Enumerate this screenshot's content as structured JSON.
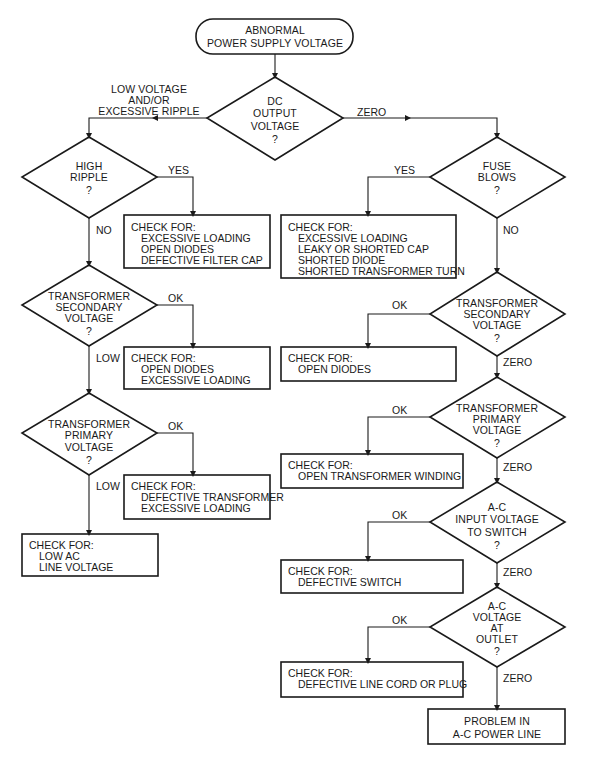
{
  "diagram": {
    "type": "flowchart",
    "topic": "Power supply troubleshooting",
    "start": {
      "line1": "ABNORMAL",
      "line2": "POWER SUPPLY VOLTAGE"
    },
    "decisions": {
      "dc_output": {
        "lines": [
          "DC",
          "OUTPUT",
          "VOLTAGE",
          "?"
        ]
      },
      "high_ripple": {
        "lines": [
          "HIGH",
          "RIPPLE",
          "?"
        ]
      },
      "fuse_blows": {
        "lines": [
          "FUSE",
          "BLOWS",
          "?"
        ]
      },
      "left_secondary": {
        "lines": [
          "TRANSFORMER",
          "SECONDARY",
          "VOLTAGE",
          "?"
        ]
      },
      "left_primary": {
        "lines": [
          "TRANSFORMER",
          "PRIMARY",
          "VOLTAGE",
          "?"
        ]
      },
      "right_secondary": {
        "lines": [
          "TRANSFORMER",
          "SECONDARY",
          "VOLTAGE",
          "?"
        ]
      },
      "right_primary": {
        "lines": [
          "TRANSFORMER",
          "PRIMARY",
          "VOLTAGE",
          "?"
        ]
      },
      "ac_input": {
        "lines": [
          "A-C",
          "INPUT VOLTAGE",
          "TO SWITCH",
          "?"
        ]
      },
      "ac_outlet": {
        "lines": [
          "A-C",
          "VOLTAGE",
          "AT",
          "OUTLET",
          "?"
        ]
      }
    },
    "edge_labels": {
      "low_voltage": [
        "LOW VOLTAGE",
        "AND/OR",
        "EXCESSIVE RIPPLE"
      ],
      "zero_dc": "ZERO",
      "ripple_yes": "YES",
      "ripple_no": "NO",
      "fuse_yes": "YES",
      "fuse_no": "NO",
      "lsec_ok": "OK",
      "lsec_low": "LOW",
      "lpri_ok": "OK",
      "lpri_low": "LOW",
      "rsec_ok": "OK",
      "rsec_zero": "ZERO",
      "rpri_ok": "OK",
      "rpri_zero": "ZERO",
      "acin_ok": "OK",
      "acin_zero": "ZERO",
      "outlet_ok": "OK",
      "outlet_zero": "ZERO"
    },
    "checks": {
      "ripple": {
        "head": "CHECK FOR:",
        "items": [
          "EXCESSIVE LOADING",
          "OPEN DIODES",
          "DEFECTIVE FILTER CAP"
        ]
      },
      "fuse": {
        "head": "CHECK FOR:",
        "items": [
          "EXCESSIVE LOADING",
          "LEAKY OR SHORTED CAP",
          "SHORTED DIODE",
          "SHORTED TRANSFORMER TURN"
        ]
      },
      "lsec": {
        "head": "CHECK FOR:",
        "items": [
          "OPEN DIODES",
          "EXCESSIVE LOADING"
        ]
      },
      "lpri": {
        "head": "CHECK FOR:",
        "items": [
          "DEFECTIVE TRANSFORMER",
          "EXCESSIVE LOADING"
        ]
      },
      "low_ac": {
        "head": "CHECK FOR:",
        "items": [
          "LOW AC",
          "LINE VOLTAGE"
        ]
      },
      "rsec": {
        "head": "CHECK FOR:",
        "items": [
          "OPEN DIODES"
        ]
      },
      "rpri": {
        "head": "CHECK FOR:",
        "items": [
          "OPEN TRANSFORMER WINDING"
        ]
      },
      "acin": {
        "head": "CHECK FOR:",
        "items": [
          "DEFECTIVE SWITCH"
        ]
      },
      "outlet": {
        "head": "CHECK FOR:",
        "items": [
          "DEFECTIVE LINE CORD OR PLUG"
        ]
      }
    },
    "end": {
      "line1": "PROBLEM IN",
      "line2": "A-C POWER LINE"
    },
    "colors": {
      "line": "#1a1a1a",
      "background": "#ffffff"
    }
  }
}
